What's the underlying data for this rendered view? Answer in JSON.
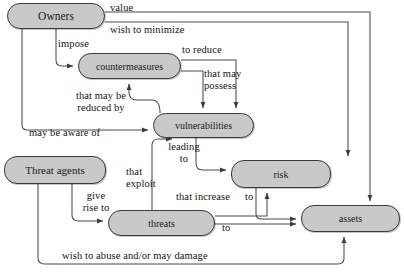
{
  "diagram": {
    "background_color": "#ffffff",
    "node_fill": "#c9c9c9",
    "node_stroke": "#3a3a3a",
    "edge_stroke": "#4a4a4a",
    "text_color": "#141414",
    "nodes": [
      {
        "id": "owners",
        "label": "Owners",
        "x": 7,
        "y": 3,
        "w": 98,
        "h": 26,
        "font_size": 11.5
      },
      {
        "id": "countermeasures",
        "label": "countermeasures",
        "x": 78,
        "y": 53,
        "w": 103,
        "h": 26,
        "font_size": 10
      },
      {
        "id": "vulnerabilities",
        "label": "vulnerabilities",
        "x": 153,
        "y": 113,
        "w": 101,
        "h": 25,
        "font_size": 10
      },
      {
        "id": "threat-agents",
        "label": "Threat agents",
        "x": 4,
        "y": 156,
        "w": 102,
        "h": 28,
        "font_size": 11
      },
      {
        "id": "threats",
        "label": "threats",
        "x": 108,
        "y": 210,
        "w": 107,
        "h": 26,
        "font_size": 10
      },
      {
        "id": "risk",
        "label": "risk",
        "x": 231,
        "y": 160,
        "w": 100,
        "h": 28,
        "font_size": 10
      },
      {
        "id": "assets",
        "label": "assets",
        "x": 301,
        "y": 205,
        "w": 99,
        "h": 27,
        "font_size": 10
      }
    ],
    "edge_labels": [
      {
        "id": "value",
        "text": "value",
        "x": 110,
        "y": 2,
        "font_size": 10.5,
        "align": "left"
      },
      {
        "id": "wish-to-minimize",
        "text": "wish to minimize",
        "x": 110,
        "y": 24,
        "font_size": 10.5,
        "align": "left"
      },
      {
        "id": "impose",
        "text": "impose",
        "x": 58,
        "y": 38,
        "font_size": 10.5,
        "align": "left"
      },
      {
        "id": "to-reduce",
        "text": "to reduce",
        "x": 182,
        "y": 44,
        "font_size": 10.5,
        "align": "left"
      },
      {
        "id": "that-may-possess",
        "text": "that may\npossess",
        "x": 204,
        "y": 68,
        "font_size": 10.5,
        "align": "left"
      },
      {
        "id": "that-may-be-reduced-by",
        "text": "that may be\nreduced by",
        "x": 57,
        "y": 90,
        "font_size": 10.5,
        "align": "center"
      },
      {
        "id": "may-be-aware-of",
        "text": "may be aware of",
        "x": 29,
        "y": 127,
        "font_size": 10.5,
        "align": "left"
      },
      {
        "id": "leading-to",
        "text": "leading\nto",
        "x": 163,
        "y": 141,
        "font_size": 10.5,
        "align": "center"
      },
      {
        "id": "that-exploit",
        "text": "that\nexploit",
        "x": 126,
        "y": 166,
        "font_size": 10.5,
        "align": "left"
      },
      {
        "id": "give-rise-to",
        "text": "give\nrise to",
        "x": 77,
        "y": 190,
        "font_size": 10.5,
        "align": "center"
      },
      {
        "id": "that-increase",
        "text": "that increase",
        "x": 176,
        "y": 191,
        "font_size": 10.5,
        "align": "left"
      },
      {
        "id": "to-threats-assets",
        "text": "to",
        "x": 222,
        "y": 222,
        "font_size": 10.5,
        "align": "left"
      },
      {
        "id": "to-risk-assets",
        "text": "to",
        "x": 245,
        "y": 191,
        "font_size": 10.5,
        "align": "left"
      },
      {
        "id": "wish-to-abuse",
        "text": "wish to abuse and/or may damage",
        "x": 62,
        "y": 250,
        "font_size": 10.5,
        "align": "left"
      }
    ],
    "relationships": [
      {
        "from": "owners",
        "to": "assets",
        "label": "value"
      },
      {
        "from": "owners",
        "to": "risk",
        "label": "wish to minimize"
      },
      {
        "from": "owners",
        "to": "countermeasures",
        "label": "impose"
      },
      {
        "from": "countermeasures",
        "to": "vulnerabilities",
        "label": "to reduce"
      },
      {
        "from": "countermeasures",
        "to": "vulnerabilities",
        "label": "that may possess"
      },
      {
        "from": "vulnerabilities",
        "to": "countermeasures",
        "label": "that may be reduced by"
      },
      {
        "from": "owners",
        "to": "vulnerabilities",
        "label": "may be aware of"
      },
      {
        "from": "vulnerabilities",
        "to": "risk",
        "label": "leading to"
      },
      {
        "from": "threats",
        "to": "vulnerabilities",
        "label": "that exploit"
      },
      {
        "from": "threat-agents",
        "to": "threats",
        "label": "give rise to"
      },
      {
        "from": "threats",
        "to": "risk",
        "label": "that increase"
      },
      {
        "from": "threats",
        "to": "assets",
        "label": "to"
      },
      {
        "from": "risk",
        "to": "assets",
        "label": "to"
      },
      {
        "from": "threat-agents",
        "to": "assets",
        "label": "wish to abuse and/or may damage"
      }
    ]
  }
}
